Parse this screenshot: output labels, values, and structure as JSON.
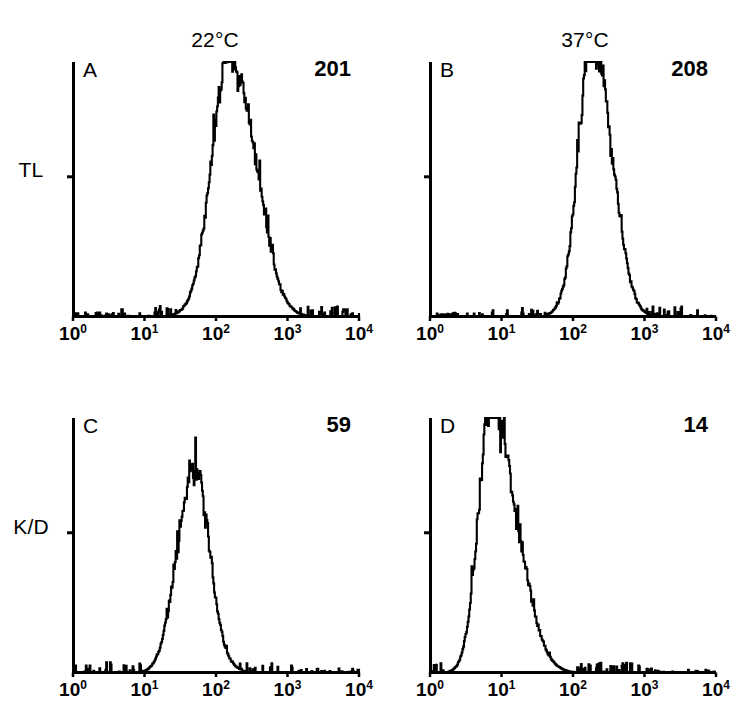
{
  "figure": {
    "background_color": "#ffffff",
    "ink_color": "#000000",
    "column_titles": [
      {
        "label": "22°C",
        "center_x": 215
      },
      {
        "label": "37°C",
        "center_x": 585
      }
    ],
    "row_labels": [
      {
        "label": "TL",
        "center_x": 30,
        "center_y": 170
      },
      {
        "label": "K/D",
        "center_x": 30,
        "center_y": 527
      }
    ],
    "axis": {
      "tick_labels": [
        "10",
        "10",
        "10",
        "10",
        "10"
      ],
      "tick_exponents": [
        "0",
        "1",
        "2",
        "3",
        "4"
      ],
      "x_min_decade": 0,
      "x_max_decade": 4
    }
  },
  "chart_data": {
    "type": "line",
    "title": "",
    "xlabel": "",
    "ylabel": "",
    "x_scale": "log",
    "xlim": [
      1,
      10000
    ],
    "xticks": [
      1,
      10,
      100,
      1000,
      10000
    ],
    "xticklabels": [
      "10^0",
      "10^1",
      "10^2",
      "10^3",
      "10^4"
    ],
    "grid": false,
    "legend": false,
    "panels": [
      {
        "letter": "A",
        "row": "TL",
        "column": "22°C",
        "mean_value": "201",
        "peak_decade": 2.3,
        "peak_height_frac": 0.92,
        "left_edge_decade": 1.55,
        "right_edge_decade": 2.95,
        "width_decades": 0.3,
        "skew": 0.0,
        "noise_seed": 17,
        "noise_amp": 0.085,
        "spike_amp": 0.13,
        "baseline_noise": 0.022,
        "shoulder_decade": 2.05,
        "shoulder_amp": 0.3,
        "geometry": {
          "x": 73,
          "y": 62,
          "width": 286,
          "height": 255
        }
      },
      {
        "letter": "B",
        "row": "TL",
        "column": "37°C",
        "mean_value": "208",
        "peak_decade": 2.35,
        "peak_height_frac": 0.94,
        "left_edge_decade": 1.75,
        "right_edge_decade": 2.9,
        "width_decades": 0.235,
        "skew": 0.0,
        "noise_seed": 42,
        "noise_amp": 0.1,
        "spike_amp": 0.17,
        "baseline_noise": 0.02,
        "shoulder_decade": 2.18,
        "shoulder_amp": 0.34,
        "geometry": {
          "x": 430,
          "y": 62,
          "width": 286,
          "height": 255
        }
      },
      {
        "letter": "C",
        "row": "K/D",
        "column": "22°C",
        "mean_value": "59",
        "peak_decade": 1.62,
        "peak_height_frac": 0.66,
        "left_edge_decade": 0.85,
        "right_edge_decade": 2.2,
        "width_decades": 0.235,
        "skew": 0.05,
        "noise_seed": 73,
        "noise_amp": 0.095,
        "spike_amp": 0.14,
        "baseline_noise": 0.03,
        "shoulder_decade": 1.78,
        "shoulder_amp": 0.4,
        "geometry": {
          "x": 73,
          "y": 418,
          "width": 286,
          "height": 255
        }
      },
      {
        "letter": "D",
        "row": "K/D",
        "column": "37°C",
        "mean_value": "14",
        "peak_decade": 0.95,
        "peak_height_frac": 0.9,
        "left_edge_decade": 0.05,
        "right_edge_decade": 2.15,
        "width_decades": 0.265,
        "skew": 0.1,
        "noise_seed": 11,
        "noise_amp": 0.085,
        "spike_amp": 0.15,
        "baseline_noise": 0.022,
        "shoulder_decade": 0.78,
        "shoulder_amp": 0.36,
        "geometry": {
          "x": 430,
          "y": 418,
          "width": 286,
          "height": 255
        }
      }
    ]
  }
}
